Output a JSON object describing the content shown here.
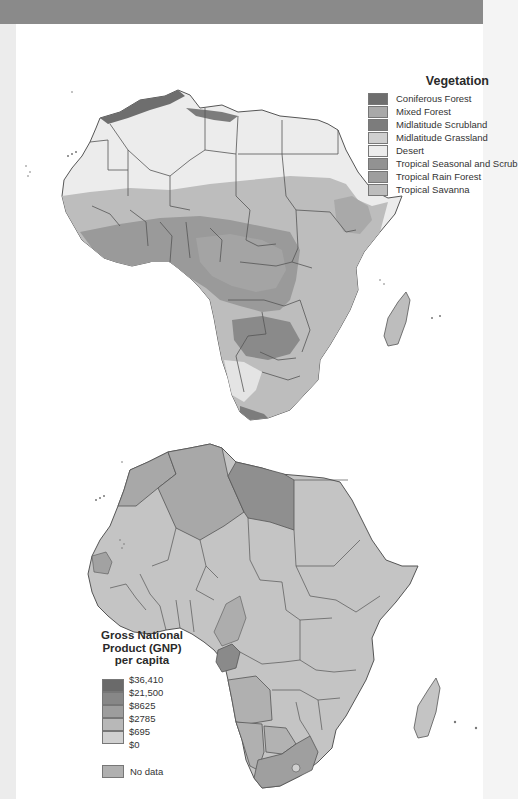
{
  "page": {
    "background": "#ffffff",
    "band_color": "#8a8a8a"
  },
  "vegetation_map": {
    "legend": {
      "title": "Vegetation",
      "items": [
        {
          "label": "Coniferous Forest",
          "color": "#6e6e6e"
        },
        {
          "label": "Mixed Forest",
          "color": "#a9a9a9"
        },
        {
          "label": "Midlatitude Scrubland",
          "color": "#7c7c7c"
        },
        {
          "label": "Midlatitude Grassland",
          "color": "#cfcfcf"
        },
        {
          "label": "Desert",
          "color": "#ececec"
        },
        {
          "label": "Tropical Seasonal and Scrub",
          "color": "#929292"
        },
        {
          "label": "Tropical Rain Forest",
          "color": "#9e9e9e"
        },
        {
          "label": "Tropical Savanna",
          "color": "#bdbdbd"
        }
      ]
    }
  },
  "gnp_map": {
    "legend": {
      "title_line1": "Gross National",
      "title_line2": "Product (GNP)",
      "title_line3": "per capita",
      "breaks": [
        "$36,410",
        "$21,500",
        "$8625",
        "$2785",
        "$695",
        "$0"
      ],
      "colors": [
        "#6a6a6a",
        "#878787",
        "#9d9d9d",
        "#b8b8b8",
        "#d0d0d0"
      ],
      "no_data_label": "No data",
      "no_data_color": "#b0b0b0"
    },
    "highlighted": {
      "libya": "#8f8f8f",
      "algeria_morocco": "#a8a8a8",
      "south_africa": "#9f9f9f",
      "angola_namibia_botswana": "#b0b0b0",
      "gabon": "#8a8a8a",
      "default": "#c4c4c4"
    }
  }
}
